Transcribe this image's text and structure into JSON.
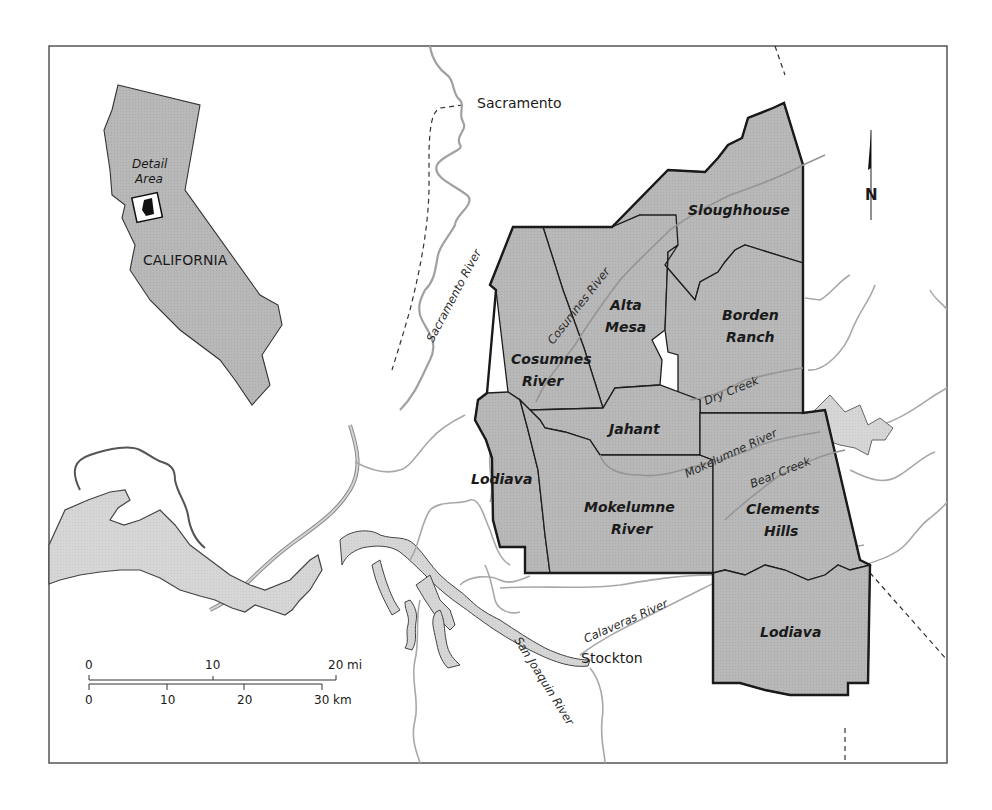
{
  "map": {
    "colors": {
      "region_fill": "#b3b3b3",
      "water_fill": "#d4d4d4",
      "river_stroke": "#a0a0a0",
      "boundary_stroke": "#1e1e1e",
      "frame_stroke": "#555555",
      "background": "#ffffff"
    },
    "inset": {
      "state_label": "CALIFORNIA",
      "detail_label_line1": "Detail",
      "detail_label_line2": "Area"
    },
    "north_arrow": {
      "label": "N"
    },
    "cities": [
      {
        "name": "Sacramento"
      },
      {
        "name": "Stockton"
      }
    ],
    "rivers": [
      {
        "name": "Sacramento River"
      },
      {
        "name": "Cosumnes River"
      },
      {
        "name": "Dry Creek"
      },
      {
        "name": "Mokelumne River"
      },
      {
        "name": "Bear Creek"
      },
      {
        "name": "Calaveras River"
      },
      {
        "name": "San Joaquin River"
      }
    ],
    "regions": [
      {
        "line1": "Sloughhouse",
        "line2": ""
      },
      {
        "line1": "Alta",
        "line2": "Mesa"
      },
      {
        "line1": "Borden",
        "line2": "Ranch"
      },
      {
        "line1": "Cosumnes",
        "line2": "River"
      },
      {
        "line1": "Jahant",
        "line2": ""
      },
      {
        "line1": "Lodiava",
        "line2": ""
      },
      {
        "line1": "Mokelumne",
        "line2": "River"
      },
      {
        "line1": "Clements",
        "line2": "Hills"
      },
      {
        "line1": "Lodiava",
        "line2": ""
      }
    ],
    "scale_bar": {
      "miles": {
        "ticks": [
          "0",
          "10",
          "20 mi"
        ]
      },
      "km": {
        "ticks": [
          "0",
          "10",
          "20",
          "30 km"
        ]
      }
    }
  }
}
